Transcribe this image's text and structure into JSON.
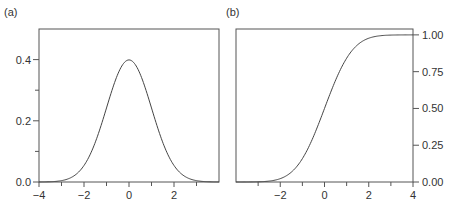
{
  "chart_data": [
    {
      "panel_label": "(a)",
      "type": "line",
      "description": "Standard normal probability density function",
      "title": "",
      "xlabel": "",
      "ylabel": "",
      "xlim": [
        -4,
        4
      ],
      "ylim": [
        0,
        0.5
      ],
      "x_ticks": [
        -4,
        -2,
        0,
        2
      ],
      "x_tick_labels": [
        "−4",
        "−2",
        "0",
        "2"
      ],
      "x_minor_ticks": [
        -3,
        -1,
        1,
        3
      ],
      "y_ticks": [
        0.0,
        0.2,
        0.4
      ],
      "y_tick_labels": [
        "0.0",
        "0.2",
        "0.4"
      ],
      "y_minor_ticks": [
        0.1,
        0.3
      ],
      "y_axis_side": "left",
      "grid": false,
      "legend": null,
      "series": [
        {
          "name": "pdf",
          "function": "normal_pdf",
          "mean": 0,
          "sd": 1,
          "x": [
            -4,
            -3.5,
            -3,
            -2.5,
            -2,
            -1.5,
            -1,
            -0.5,
            0,
            0.5,
            1,
            1.5,
            2,
            2.5,
            3,
            3.5,
            4
          ],
          "values": [
            0.0001,
            0.0009,
            0.0044,
            0.0175,
            0.054,
            0.1295,
            0.242,
            0.3521,
            0.3989,
            0.3521,
            0.242,
            0.1295,
            0.054,
            0.0175,
            0.0044,
            0.0009,
            0.0001
          ]
        }
      ]
    },
    {
      "panel_label": "(b)",
      "type": "line",
      "description": "Standard normal cumulative distribution function",
      "title": "",
      "xlabel": "",
      "ylabel": "",
      "xlim": [
        -4,
        4
      ],
      "ylim": [
        0,
        1.04
      ],
      "x_ticks": [
        -2,
        0,
        2,
        4
      ],
      "x_tick_labels": [
        "−2",
        "0",
        "2",
        "4"
      ],
      "x_minor_ticks": [
        -3,
        -1,
        1,
        3
      ],
      "y_ticks": [
        0.0,
        0.25,
        0.5,
        0.75,
        1.0
      ],
      "y_tick_labels": [
        "0.00",
        "0.25",
        "0.50",
        "0.75",
        "1.00"
      ],
      "y_axis_side": "right",
      "grid": false,
      "legend": null,
      "series": [
        {
          "name": "cdf",
          "function": "normal_cdf",
          "mean": 0,
          "sd": 1,
          "x": [
            -4,
            -3.5,
            -3,
            -2.5,
            -2,
            -1.5,
            -1,
            -0.5,
            0,
            0.5,
            1,
            1.5,
            2,
            2.5,
            3,
            3.5,
            4
          ],
          "values": [
            0.0,
            0.0002,
            0.0013,
            0.0062,
            0.0228,
            0.0668,
            0.1587,
            0.3085,
            0.5,
            0.6915,
            0.8413,
            0.9332,
            0.9772,
            0.9938,
            0.9987,
            0.9998,
            1.0
          ]
        }
      ]
    }
  ],
  "panels": {
    "a": {
      "label": "(a)"
    },
    "b": {
      "label": "(b)"
    }
  },
  "colors": {
    "axis": "#555555",
    "curve": "#444444",
    "text": "#333333",
    "background": "#ffffff"
  }
}
